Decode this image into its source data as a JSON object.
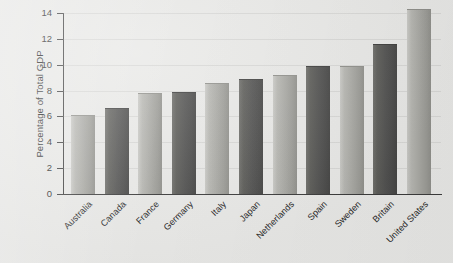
{
  "chart_data": {
    "type": "bar",
    "title": "",
    "xlabel": "",
    "ylabel": "Percentage of Total GDP",
    "ylim": [
      0,
      14
    ],
    "yticks": [
      0,
      2,
      4,
      6,
      8,
      10,
      12,
      14
    ],
    "grid": false,
    "legend": "none",
    "categories": [
      "Australia",
      "Canada",
      "France",
      "Germany",
      "Italy",
      "Japan",
      "Netherlands",
      "Spain",
      "Sweden",
      "Britain",
      "United States"
    ],
    "values": [
      6.0,
      6.6,
      7.7,
      7.8,
      8.5,
      8.8,
      9.1,
      9.8,
      9.8,
      11.5,
      14.2
    ],
    "bar_shades": [
      "light",
      "dark",
      "light",
      "dark",
      "light",
      "dark",
      "light",
      "dark",
      "light",
      "dark",
      "light"
    ]
  },
  "colors": {
    "background": "#e8e8e6",
    "axis": "#3b3b3b",
    "text": "#1f1f1f",
    "bar_light": "#a6a6a1",
    "bar_dark": "#515150"
  }
}
